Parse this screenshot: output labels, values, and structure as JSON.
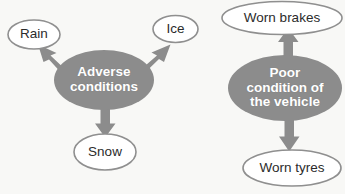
{
  "diagram": {
    "background_color": "#f8f8f6",
    "hub_fill_color": "#8c8c8c",
    "hub_text_color": "#ffffff",
    "leaf_stroke_color": "#8f8f8f",
    "leaf_fill_color": "#ffffff",
    "leaf_text_color": "#2b2b2b",
    "arrow_color": "#8c8c8c",
    "clusters": [
      {
        "id": "adverse-conditions",
        "hub": {
          "name": "adverse-conditions",
          "lines": [
            "Adverse",
            "conditions"
          ],
          "text": "Adverse conditions"
        },
        "leaves": [
          {
            "name": "rain",
            "label": "Rain"
          },
          {
            "name": "ice",
            "label": "Ice"
          },
          {
            "name": "snow",
            "label": "Snow"
          }
        ]
      },
      {
        "id": "poor-condition-of-the-vehicle",
        "hub": {
          "name": "poor-condition-of-the-vehicle",
          "lines": [
            "Poor",
            "condition of",
            "the vehicle"
          ],
          "text": "Poor condition of the vehicle"
        },
        "leaves": [
          {
            "name": "worn-brakes",
            "label": "Worn brakes"
          },
          {
            "name": "worn-tyres",
            "label": "Worn tyres"
          }
        ]
      }
    ]
  }
}
